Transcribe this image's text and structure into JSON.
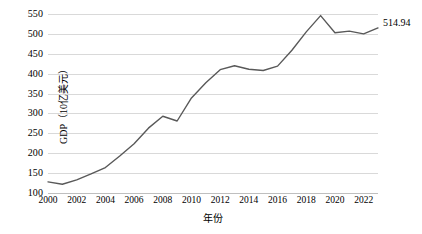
{
  "chart_data": {
    "type": "line",
    "title": "",
    "xlabel": "年份",
    "ylabel": "GDP（10亿美元）",
    "x": [
      2000,
      2001,
      2002,
      2003,
      2004,
      2005,
      2006,
      2007,
      2008,
      2009,
      2010,
      2011,
      2012,
      2013,
      2014,
      2015,
      2016,
      2017,
      2018,
      2019,
      2020,
      2021,
      2022,
      2023
    ],
    "values": [
      128,
      122,
      133,
      148,
      164,
      193,
      224,
      263,
      293,
      281,
      339,
      377,
      410,
      420,
      411,
      408,
      419,
      459,
      505,
      546,
      503,
      507,
      500,
      514.94
    ],
    "series": [
      {
        "name": "GDP",
        "values": [
          128,
          122,
          133,
          148,
          164,
          193,
          224,
          263,
          293,
          281,
          339,
          377,
          410,
          420,
          411,
          408,
          419,
          459,
          505,
          546,
          503,
          507,
          500,
          514.94
        ]
      }
    ],
    "xlim": [
      2000,
      2023
    ],
    "ylim": [
      100,
      550
    ],
    "y_ticks": [
      100,
      150,
      200,
      250,
      300,
      350,
      400,
      450,
      500,
      550
    ],
    "x_ticks": [
      2000,
      2002,
      2004,
      2006,
      2008,
      2010,
      2012,
      2014,
      2016,
      2018,
      2020,
      2022
    ],
    "grid": "horizontal",
    "legend": "none",
    "line_color": "#595959",
    "grid_color": "#d9d9d9",
    "background_color": "#ffffff",
    "annotations": [
      {
        "name": "end-value-label",
        "text": "514.94",
        "x": 2023,
        "y": 514.94
      }
    ]
  }
}
